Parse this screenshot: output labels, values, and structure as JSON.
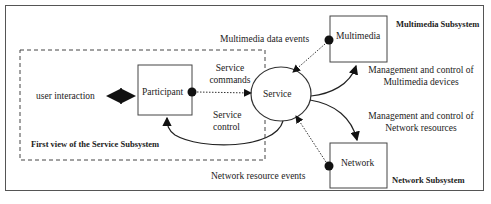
{
  "diagram": {
    "boxes": {
      "participant": "Participant",
      "service": "Service",
      "multimedia": "Multimedia",
      "network": "Network"
    },
    "labels": {
      "user_interaction": "user interaction",
      "service_commands_1": "Service",
      "service_commands_2": "commands",
      "service_control_1": "Service",
      "service_control_2": "control",
      "multimedia_events": "Multimedia data  events",
      "network_events": "Network resource events",
      "mm_mgmt_1": "Management and control of",
      "mm_mgmt_2": "Multimedia devices",
      "net_mgmt_1": "Management and control of",
      "net_mgmt_2": "Network resources"
    },
    "titles": {
      "service_subsystem": "First view of the Service Subsystem",
      "multimedia_subsystem": "Multimedia Subsystem",
      "network_subsystem": "Network Subsystem"
    }
  }
}
